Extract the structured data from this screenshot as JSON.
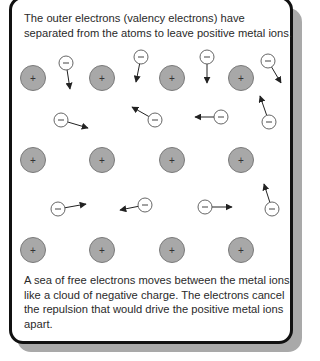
{
  "panel": {
    "top_text": "The outer electrons (valency electrons) have separated from the atoms to leave positive metal ions.",
    "bottom_text": "A sea of free electrons moves between the metal ions like a cloud of negative charge. The electrons cancel the repulsion that would drive the positive metal ions apart."
  },
  "legend": {
    "ion_symbol": "+",
    "electron_symbol": "−"
  },
  "colors": {
    "ion_fill": "#a8a8a8",
    "ion_stroke": "#7a7a7a",
    "electron_fill": "#ffffff",
    "electron_stroke": "#555555",
    "arrow": "#222222",
    "frame_border": "#111111",
    "shadow": "#a9a9a9"
  },
  "ions": [
    {
      "x": 33,
      "y": 78
    },
    {
      "x": 102,
      "y": 78
    },
    {
      "x": 172,
      "y": 78
    },
    {
      "x": 241,
      "y": 78
    },
    {
      "x": 33,
      "y": 160
    },
    {
      "x": 102,
      "y": 160
    },
    {
      "x": 172,
      "y": 160
    },
    {
      "x": 241,
      "y": 160
    },
    {
      "x": 33,
      "y": 250
    },
    {
      "x": 102,
      "y": 250
    },
    {
      "x": 172,
      "y": 250
    },
    {
      "x": 241,
      "y": 250
    }
  ],
  "electrons": [
    {
      "x": 66,
      "y": 63,
      "ax": 70,
      "ay": 89
    },
    {
      "x": 141,
      "y": 57,
      "ax": 136,
      "ay": 82
    },
    {
      "x": 207,
      "y": 57,
      "ax": 207,
      "ay": 83
    },
    {
      "x": 268,
      "y": 61,
      "ax": 281,
      "ay": 83
    },
    {
      "x": 61,
      "y": 120,
      "ax": 88,
      "ay": 128
    },
    {
      "x": 155,
      "y": 120,
      "ax": 132,
      "ay": 107
    },
    {
      "x": 221,
      "y": 117,
      "ax": 195,
      "ay": 117
    },
    {
      "x": 269,
      "y": 122,
      "ax": 260,
      "ay": 96
    },
    {
      "x": 58,
      "y": 209,
      "ax": 86,
      "ay": 204
    },
    {
      "x": 145,
      "y": 205,
      "ax": 120,
      "ay": 210
    },
    {
      "x": 205,
      "y": 207,
      "ax": 232,
      "ay": 207
    },
    {
      "x": 272,
      "y": 209,
      "ax": 264,
      "ay": 184
    }
  ],
  "caption": "Figure: metallic bonding"
}
